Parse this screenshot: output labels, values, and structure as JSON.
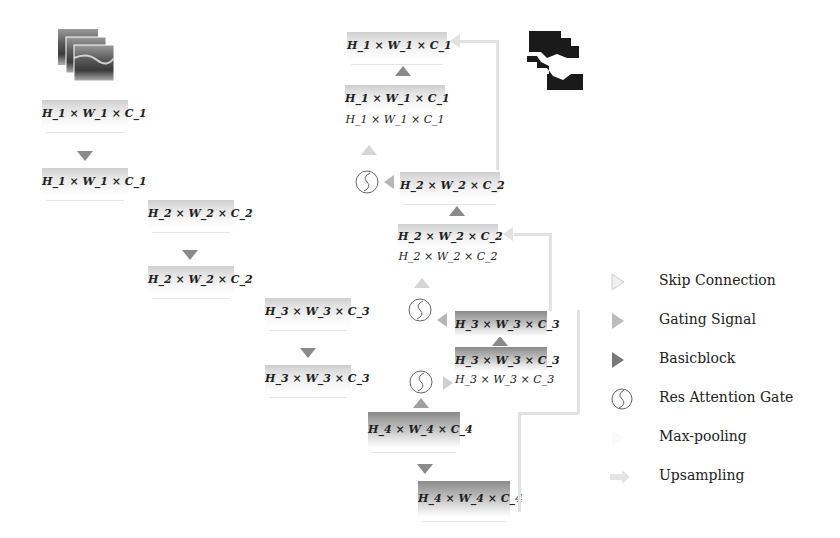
{
  "figure": {
    "type": "network-architecture-diagram",
    "images": {
      "input": "ultrasound-image-stack",
      "output": "segmentation-mask-stack"
    },
    "encoder": [
      {
        "level": 1,
        "top": "H_1 × W_1 × C_1",
        "bottom": "H_1 × W_1 × C_1"
      },
      {
        "level": 2,
        "top": "H_2 × W_2 × C_2",
        "bottom": "H_2 × W_2 × C_2"
      },
      {
        "level": 3,
        "top": "H_3 × W_3 × C_3",
        "bottom": "H_3 × W_3 × C_3"
      },
      {
        "level": 4,
        "top": "H_4 × W_4 × C_4",
        "bottom": "H_4 × W_4 × C_4"
      }
    ],
    "decoder": [
      {
        "level": 1,
        "output": "H_1 × W_1 × C_1",
        "concat_a": "H_1 × W_1 × C_1",
        "concat_b": "H_1 × W_1 × C_1"
      },
      {
        "level": 2,
        "output": "H_2 × W_2 × C_2",
        "concat_a": "H_2 × W_2 × C_2",
        "concat_b": "H_2 × W_2 × C_2"
      },
      {
        "level": 3,
        "output": "H_3 × W_3 × C_3",
        "concat_a": "H_3 × W_3 × C_3",
        "concat_b": "H_3 × W_3 × C_3"
      }
    ]
  },
  "legend": {
    "items": [
      {
        "icon": "skip-connection-icon",
        "label": "Skip Connection"
      },
      {
        "icon": "gating-signal-icon",
        "label": "Gating Signal"
      },
      {
        "icon": "basicblock-icon",
        "label": "Basicblock"
      },
      {
        "icon": "res-attention-gate-icon",
        "label": "Res Attention Gate"
      },
      {
        "icon": "max-pooling-icon",
        "label": "Max-pooling"
      },
      {
        "icon": "upsampling-icon",
        "label": "Upsampling"
      }
    ]
  },
  "colors": {
    "basicblock": "#8a8a8a",
    "gating": "#b6b6b6",
    "skip": "#d6d6d6",
    "upsampling_line": "#e2e2e2",
    "mask": "#1a1a1a"
  }
}
